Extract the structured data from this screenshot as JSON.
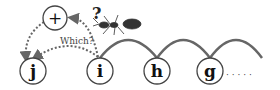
{
  "nodes": [
    {
      "id": "j",
      "label": "j",
      "x": 33,
      "y": 71
    },
    {
      "id": "i",
      "label": "i",
      "x": 100,
      "y": 71
    },
    {
      "id": "h",
      "label": "h",
      "x": 157,
      "y": 71
    },
    {
      "id": "g",
      "label": "g",
      "x": 210,
      "y": 71
    },
    {
      "id": "plus",
      "label": "+",
      "x": 55,
      "y": 18
    }
  ],
  "question_mark": "?",
  "which_label": "Which?",
  "ellipsis": "· · · · ·",
  "colors": {
    "stroke": "#555555",
    "dotted": "#666666",
    "text": "#111111"
  }
}
